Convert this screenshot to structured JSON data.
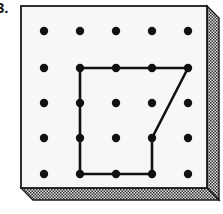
{
  "figure": {
    "kind": "geoboard-diagram",
    "problem_label": "3.",
    "caption": "",
    "canvas": {
      "width": 223,
      "height": 214
    }
  },
  "colors": {
    "page_background": "#ffffff",
    "board_face": "#f7f7f5",
    "board_outline": "#1a1a1a",
    "pin": "#111111",
    "rubber_band": "#111111",
    "edge_stipple_dark": "#2b2b2b",
    "edge_stipple_light": "#e8e8e6",
    "edge_panel_base": "#d9d9d5"
  },
  "board": {
    "face": {
      "x": 21,
      "y": 6,
      "width": 186,
      "height": 182
    },
    "outline_width": 1.6,
    "right_edge": {
      "name": "right-bevel-panel",
      "points": "207,6 219,18 219,200 207,188",
      "fill": "stipple"
    },
    "bottom_edge": {
      "name": "bottom-bevel-panel",
      "points": "21,188 207,188 219,200 33,200",
      "fill": "stipple"
    }
  },
  "pin_grid": {
    "rows": 5,
    "cols": 5,
    "spacing_x": 36,
    "spacing_y": 35.75,
    "origin_x": 44,
    "origin_y": 31,
    "pin_radius": 4.2,
    "pin_count": 25,
    "row_labels": [
      "1",
      "2",
      "3",
      "4",
      "5"
    ],
    "col_labels": [
      "A",
      "B",
      "C",
      "D",
      "E"
    ],
    "pins": [
      {
        "row": 1,
        "col": 1,
        "x": 44,
        "y": 31
      },
      {
        "row": 1,
        "col": 2,
        "x": 80,
        "y": 31
      },
      {
        "row": 1,
        "col": 3,
        "x": 116,
        "y": 31
      },
      {
        "row": 1,
        "col": 4,
        "x": 152,
        "y": 31
      },
      {
        "row": 1,
        "col": 5,
        "x": 188,
        "y": 31
      },
      {
        "row": 2,
        "col": 1,
        "x": 44,
        "y": 68
      },
      {
        "row": 2,
        "col": 2,
        "x": 80,
        "y": 68
      },
      {
        "row": 2,
        "col": 3,
        "x": 116,
        "y": 68
      },
      {
        "row": 2,
        "col": 4,
        "x": 152,
        "y": 68
      },
      {
        "row": 2,
        "col": 5,
        "x": 188,
        "y": 68
      },
      {
        "row": 3,
        "col": 1,
        "x": 44,
        "y": 103
      },
      {
        "row": 3,
        "col": 2,
        "x": 80,
        "y": 103
      },
      {
        "row": 3,
        "col": 3,
        "x": 116,
        "y": 103
      },
      {
        "row": 3,
        "col": 4,
        "x": 152,
        "y": 103
      },
      {
        "row": 3,
        "col": 5,
        "x": 188,
        "y": 103
      },
      {
        "row": 4,
        "col": 1,
        "x": 44,
        "y": 138
      },
      {
        "row": 4,
        "col": 2,
        "x": 80,
        "y": 138
      },
      {
        "row": 4,
        "col": 3,
        "x": 116,
        "y": 138
      },
      {
        "row": 4,
        "col": 4,
        "x": 152,
        "y": 138
      },
      {
        "row": 4,
        "col": 5,
        "x": 188,
        "y": 138
      },
      {
        "row": 5,
        "col": 1,
        "x": 44,
        "y": 174
      },
      {
        "row": 5,
        "col": 2,
        "x": 80,
        "y": 174
      },
      {
        "row": 5,
        "col": 3,
        "x": 116,
        "y": 174
      },
      {
        "row": 5,
        "col": 4,
        "x": 152,
        "y": 174
      },
      {
        "row": 5,
        "col": 5,
        "x": 188,
        "y": 174
      }
    ]
  },
  "rubber_band": {
    "name": "rubber-band-polygon",
    "stroke_width": 2.6,
    "closed": true,
    "corner_radius": 5,
    "vertex_pins": [
      {
        "row": 2,
        "col": 2,
        "x": 80,
        "y": 68
      },
      {
        "row": 2,
        "col": 5,
        "x": 188,
        "y": 68
      },
      {
        "row": 4,
        "col": 4,
        "x": 152,
        "y": 138
      },
      {
        "row": 5,
        "col": 4,
        "x": 152,
        "y": 174
      },
      {
        "row": 5,
        "col": 2,
        "x": 80,
        "y": 174
      }
    ],
    "path": "M 80 68 L 188 68 L 152 138 L 152 174 L 80 174 Z",
    "description": "Closed five-sided rubber band with a notched right side"
  }
}
